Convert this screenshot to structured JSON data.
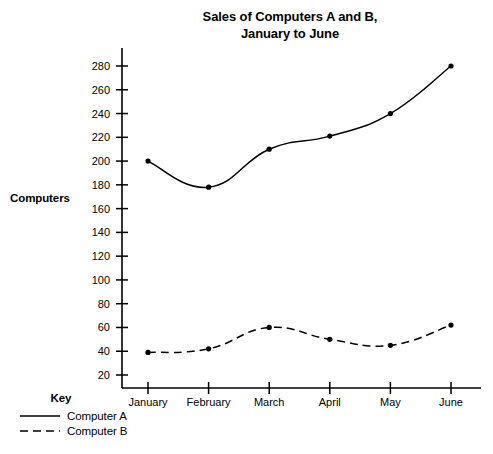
{
  "chart_data": {
    "type": "line",
    "title": "Sales of Computers A and B, January to June",
    "title_line1": "Sales of Computers A and B,",
    "title_line2": "January to June",
    "xlabel": "",
    "ylabel": "Computers",
    "categories": [
      "January",
      "February",
      "March",
      "April",
      "May",
      "June"
    ],
    "yticks": [
      20,
      40,
      60,
      80,
      100,
      120,
      140,
      160,
      180,
      200,
      220,
      240,
      260,
      280
    ],
    "ylim": [
      0,
      292
    ],
    "grid": false,
    "legend_position": "bottom-left",
    "legend_title": "Key",
    "series": [
      {
        "name": "Computer A",
        "style": "solid",
        "color": "#000000",
        "values": [
          200,
          178,
          210,
          221,
          240,
          280
        ]
      },
      {
        "name": "Computer B",
        "style": "dashed",
        "color": "#000000",
        "values": [
          39,
          42,
          60,
          50,
          45,
          62
        ]
      }
    ]
  },
  "key": {
    "title": "Key",
    "entries": [
      {
        "label": "Computer A",
        "style": "solid"
      },
      {
        "label": "Computer B",
        "style": "dashed"
      }
    ]
  }
}
